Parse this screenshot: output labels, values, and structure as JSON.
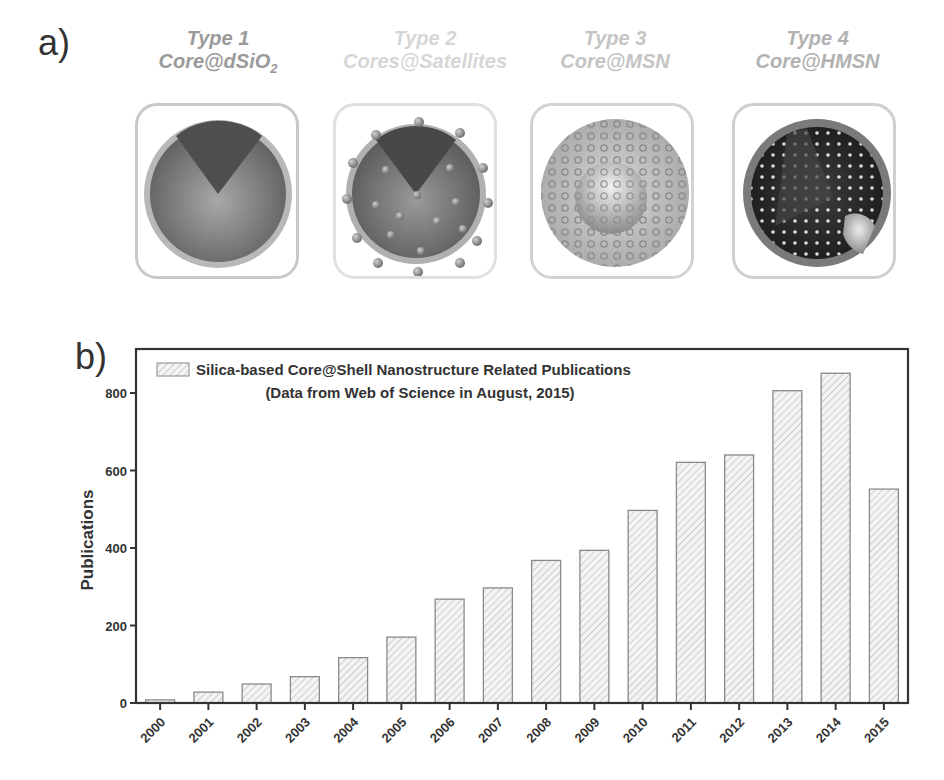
{
  "panel_a": {
    "label": "a)",
    "types": [
      {
        "title": "Type 1",
        "name": "Core@dSiO",
        "subscript": "2",
        "color": "#9a9a9a"
      },
      {
        "title": "Type 2",
        "name": "Cores@Satellites",
        "subscript": "",
        "color": "#d6d6d6"
      },
      {
        "title": "Type 3",
        "name": "Core@MSN",
        "subscript": "",
        "color": "#c4c4c4"
      },
      {
        "title": "Type 4",
        "name": "Core@HMSN",
        "subscript": "",
        "color": "#b2b2b2"
      }
    ]
  },
  "panel_b": {
    "label": "b)",
    "legend_line1": "Silica-based Core@Shell Nanostructure Related Publications",
    "legend_line2": "(Data from Web of Science in August, 2015)"
  },
  "chart_data": {
    "type": "bar",
    "title": "Silica-based Core@Shell Nanostructure Related Publications",
    "subtitle": "(Data from Web of Science in August, 2015)",
    "xlabel": "",
    "ylabel": "Publications",
    "categories": [
      "2000",
      "2001",
      "2002",
      "2003",
      "2004",
      "2005",
      "2006",
      "2007",
      "2008",
      "2009",
      "2010",
      "2011",
      "2012",
      "2013",
      "2014",
      "2015"
    ],
    "values": [
      8,
      28,
      49,
      68,
      117,
      170,
      268,
      297,
      368,
      394,
      497,
      621,
      640,
      806,
      851,
      552
    ],
    "ylim": [
      0,
      900
    ],
    "yticks": [
      0,
      200,
      400,
      600,
      800
    ],
    "grid": false,
    "legend_position": "top-left",
    "bar_fill": "diagonal hatch, light gray",
    "bar_edge": "#8a8a8a"
  }
}
